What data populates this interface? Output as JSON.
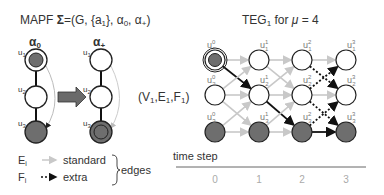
{
  "left": {
    "title_prefix": "MAPF ",
    "title_sigma": "Σ",
    "title_rest": "=(G, {a",
    "title_sub1": "1",
    "title_rest2": "}, α",
    "title_sub0": "0",
    "title_rest3": ", α",
    "title_subplus": "+",
    "title_end": ")",
    "alpha0_label": "α",
    "alpha0_sub": "0",
    "alphaplus_label": "α",
    "alphaplus_sub": "+",
    "node_labels": [
      "u",
      "u",
      "u"
    ],
    "node_subs": [
      "1",
      "2",
      "3"
    ],
    "agent_label": "a",
    "agent_sub": "1",
    "tuple_text": "(V",
    "tuple_sub1": "1",
    "tuple_mid1": ",E",
    "tuple_sub2": "1",
    "tuple_mid2": ",F",
    "tuple_sub3": "1",
    "tuple_end": ")"
  },
  "teg": {
    "title": "TEG",
    "title_sub": "1",
    "title_rest": " for ",
    "title_mu": "μ",
    "title_val": " = 4",
    "columns": [
      0,
      1,
      2,
      3
    ],
    "rows": [
      1,
      2,
      3
    ],
    "node_base": "u"
  },
  "legend": {
    "e_label": "E",
    "e_sub": "i",
    "e_text": "standard",
    "f_label": "F",
    "f_sub": "i",
    "f_text": "extra",
    "brace_text": "edges"
  },
  "axis": {
    "title": "time step",
    "ticks": [
      "0",
      "1",
      "2",
      "3"
    ]
  },
  "colors": {
    "filled_node": "#6e6e6e",
    "standard_edge": "#c8c8c8",
    "path_edge": "#111111",
    "arrow_big": "#6a6a6a"
  }
}
